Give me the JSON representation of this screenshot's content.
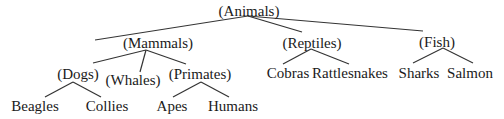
{
  "diagram": {
    "type": "tree",
    "colors": {
      "text": "#1a1a1a",
      "line": "#333333",
      "background": "#ffffff"
    },
    "nodes": {
      "animals": {
        "label": "(Animals)",
        "x": 249,
        "y": 11
      },
      "mammals": {
        "label": "(Mammals)",
        "x": 158,
        "y": 43
      },
      "reptiles": {
        "label": "(Reptiles)",
        "x": 312,
        "y": 43
      },
      "fish": {
        "label": "(Fish)",
        "x": 437,
        "y": 42
      },
      "dogs": {
        "label": "(Dogs)",
        "x": 78,
        "y": 74
      },
      "whales": {
        "label": "(Whales)",
        "x": 133,
        "y": 80
      },
      "primates": {
        "label": "(Primates)",
        "x": 200,
        "y": 74
      },
      "cobras": {
        "label": "Cobras",
        "x": 288,
        "y": 73
      },
      "rattlesnakes": {
        "label": "Rattlesnakes",
        "x": 350,
        "y": 73
      },
      "sharks": {
        "label": "Sharks",
        "x": 419,
        "y": 73
      },
      "salmon": {
        "label": "Salmon",
        "x": 470,
        "y": 73
      },
      "beagles": {
        "label": "Beagles",
        "x": 35,
        "y": 106
      },
      "collies": {
        "label": "Collies",
        "x": 107,
        "y": 106
      },
      "apes": {
        "label": "Apes",
        "x": 172,
        "y": 106
      },
      "humans": {
        "label": "Humans",
        "x": 233,
        "y": 106
      }
    },
    "edges": [
      {
        "from": "animals",
        "to": "mammals",
        "x1": 248,
        "y1": 16,
        "x2": 95,
        "y2": 40
      },
      {
        "from": "animals",
        "to": "reptiles",
        "x1": 248,
        "y1": 16,
        "x2": 302,
        "y2": 32
      },
      {
        "from": "animals",
        "to": "fish",
        "x1": 248,
        "y1": 16,
        "x2": 423,
        "y2": 31
      },
      {
        "from": "mammals",
        "to": "dogs",
        "x1": 146,
        "y1": 50,
        "x2": 93,
        "y2": 63
      },
      {
        "from": "mammals",
        "to": "whales",
        "x1": 146,
        "y1": 50,
        "x2": 140,
        "y2": 72
      },
      {
        "from": "mammals",
        "to": "primates",
        "x1": 146,
        "y1": 50,
        "x2": 186,
        "y2": 64
      },
      {
        "from": "reptiles",
        "to": "cobras",
        "x1": 311,
        "y1": 49,
        "x2": 283,
        "y2": 64
      },
      {
        "from": "reptiles",
        "to": "rattlesnakes",
        "x1": 311,
        "y1": 49,
        "x2": 349,
        "y2": 64
      },
      {
        "from": "fish",
        "to": "sharks",
        "x1": 443,
        "y1": 48,
        "x2": 413,
        "y2": 63
      },
      {
        "from": "fish",
        "to": "salmon",
        "x1": 443,
        "y1": 48,
        "x2": 473,
        "y2": 63
      },
      {
        "from": "dogs",
        "to": "beagles",
        "x1": 73,
        "y1": 82,
        "x2": 45,
        "y2": 97
      },
      {
        "from": "dogs",
        "to": "collies",
        "x1": 73,
        "y1": 82,
        "x2": 101,
        "y2": 97
      },
      {
        "from": "primates",
        "to": "apes",
        "x1": 201,
        "y1": 82,
        "x2": 173,
        "y2": 97
      },
      {
        "from": "primates",
        "to": "humans",
        "x1": 201,
        "y1": 82,
        "x2": 229,
        "y2": 97
      }
    ]
  }
}
